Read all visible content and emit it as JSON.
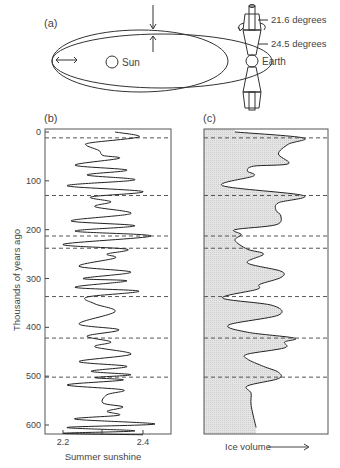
{
  "panel_a": {
    "label": "(a)",
    "sun_label": "Sun",
    "earth_label": "Earth",
    "tilt_min": "21.6 degrees",
    "tilt_max": "24.5 degrees"
  },
  "panel_b": {
    "label": "(b)",
    "ylabel": "Thousands of years ago",
    "xlabel": "Summer sunshine",
    "yticks": [
      "0",
      "100",
      "200",
      "300",
      "400",
      "500",
      "600"
    ],
    "xticks": [
      "2.2",
      "2.4"
    ]
  },
  "panel_c": {
    "label": "(c)",
    "xlabel": "Ice volume"
  },
  "dashed_lines_kya": [
    12,
    130,
    213,
    238,
    337,
    422,
    502
  ],
  "chart_data": [
    {
      "type": "line",
      "title": "(b) Summer sunshine",
      "xlabel": "Summer sunshine",
      "ylabel": "Thousands of years ago",
      "xlim": [
        2.15,
        2.46
      ],
      "ylim": [
        0,
        620
      ],
      "grid": false,
      "x": [
        2.33,
        2.39,
        2.27,
        2.26,
        2.29,
        2.3,
        2.34,
        2.23,
        2.36,
        2.26,
        2.38,
        2.21,
        2.4,
        2.27,
        2.32,
        2.28,
        2.37,
        2.22,
        2.38,
        2.23,
        2.42,
        2.2,
        2.36,
        2.31,
        2.33,
        2.24,
        2.37,
        2.25,
        2.36,
        2.23,
        2.39,
        2.26,
        2.28,
        2.33,
        2.24,
        2.34,
        2.26,
        2.32,
        2.28,
        2.37,
        2.24,
        2.36,
        2.27,
        2.37,
        2.28,
        2.35,
        2.21,
        2.35,
        2.31,
        2.3,
        2.35,
        2.31,
        2.34,
        2.23,
        2.43,
        2.21,
        2.38,
        2.2,
        2.4
      ],
      "y": [
        0,
        10,
        22,
        28,
        38,
        48,
        54,
        68,
        78,
        88,
        98,
        110,
        122,
        133,
        143,
        153,
        167,
        182,
        192,
        203,
        213,
        230,
        240,
        250,
        258,
        275,
        287,
        300,
        305,
        318,
        326,
        338,
        352,
        368,
        393,
        405,
        418,
        430,
        440,
        455,
        470,
        480,
        490,
        497,
        503,
        508,
        518,
        528,
        538,
        555,
        563,
        572,
        580,
        588,
        598,
        605,
        612,
        617,
        620
      ],
      "dashed_reference_lines": [
        12,
        130,
        213,
        238,
        337,
        422,
        502
      ]
    },
    {
      "type": "area",
      "title": "(c) Ice volume",
      "xlabel": "Ice volume",
      "ylabel": "Thousands of years ago",
      "ylim": [
        0,
        620
      ],
      "x_relative_0_to_1": [
        0.25,
        0.8,
        0.68,
        0.6,
        0.68,
        0.4,
        0.35,
        0.4,
        0.15,
        0.8,
        0.6,
        0.58,
        0.62,
        0.58,
        0.25,
        0.3,
        0.25,
        0.35,
        0.48,
        0.35,
        0.62,
        0.62,
        0.45,
        0.43,
        0.15,
        0.55,
        0.6,
        0.2,
        0.35,
        0.73,
        0.65,
        0.65,
        0.35,
        0.35,
        0.48,
        0.6,
        0.6,
        0.35,
        0.38,
        0.38,
        0.42
      ],
      "y": [
        0,
        12,
        25,
        45,
        65,
        70,
        80,
        90,
        110,
        130,
        145,
        160,
        172,
        190,
        200,
        210,
        222,
        240,
        250,
        268,
        285,
        298,
        312,
        322,
        340,
        355,
        375,
        395,
        410,
        422,
        430,
        442,
        455,
        465,
        480,
        492,
        505,
        520,
        535,
        560,
        605
      ],
      "dashed_reference_lines": [
        12,
        130,
        213,
        238,
        337,
        422,
        502
      ]
    }
  ]
}
